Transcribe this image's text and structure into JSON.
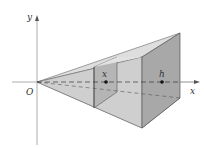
{
  "diagram": {
    "type": "3d-pyramid-volume-slice",
    "labels": {
      "y_axis": "y",
      "x_axis": "x",
      "origin": "O",
      "slice_point": "x",
      "end_point": "h"
    },
    "colors": {
      "axis": "#888888",
      "edge": "#555555",
      "face_light": "#d6d6d6",
      "face_mid": "#c4c4c4",
      "face_dark": "#a9a9a9",
      "dash": "#444444",
      "point": "#111111"
    }
  }
}
